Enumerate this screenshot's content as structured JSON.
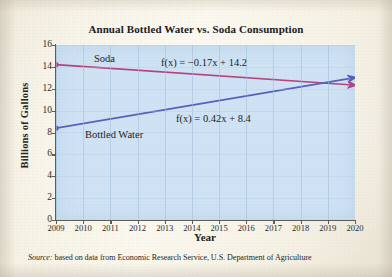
{
  "figure": {
    "title": "Annual Bottled Water vs. Soda Consumption",
    "source_prefix": "Source:",
    "source_text": " based on data from Economic Research Service, U.S. Department of Agriculture"
  },
  "axes": {
    "x_title": "Year",
    "y_title": "Billions of Gallons",
    "x_ticks": [
      "2009",
      "2010",
      "2011",
      "2012",
      "2013",
      "2014",
      "2015",
      "2016",
      "2017",
      "2018",
      "2019",
      "2020"
    ],
    "y_ticks": [
      "16",
      "14",
      "12",
      "10",
      "8",
      "6",
      "4",
      "2",
      "0"
    ]
  },
  "annotations": {
    "soda_label": "Soda",
    "bottled_water_label": "Bottled Water",
    "soda_equation_prefix": "f",
    "soda_equation": "f(x) = −0.17x + 14.2",
    "water_equation": "f(x) = 0.42x + 8.4"
  },
  "colors": {
    "plot_background": "#cfe3f5",
    "page_background": "#f4efe0",
    "soda_line": "#b8417f",
    "water_line": "#5560c0",
    "axis": "#5c5c58",
    "grid": "#a7c6e2"
  },
  "chart_data": {
    "type": "line",
    "title": "Annual Bottled Water vs. Soda Consumption",
    "xlabel": "Year",
    "ylabel": "Billions of Gallons",
    "xlim": [
      2009,
      2020
    ],
    "ylim": [
      0,
      16
    ],
    "y_ticks": [
      0,
      2,
      4,
      6,
      8,
      10,
      12,
      14,
      16
    ],
    "x_ticks": [
      2009,
      2010,
      2011,
      2012,
      2013,
      2014,
      2015,
      2016,
      2017,
      2018,
      2019,
      2020
    ],
    "grid": true,
    "legend": "inline-labels",
    "x": [
      2009,
      2020
    ],
    "series": [
      {
        "name": "Soda",
        "color": "#b8417f",
        "equation": "f(x) = -0.17x + 14.2",
        "slope": -0.17,
        "intercept": 14.2,
        "values": [
          14.2,
          12.33
        ],
        "marker_start": "dot",
        "marker_end": "arrow"
      },
      {
        "name": "Bottled Water",
        "color": "#5560c0",
        "equation": "f(x) = 0.42x + 8.4",
        "slope": 0.42,
        "intercept": 8.4,
        "values": [
          8.4,
          13.02
        ],
        "marker_start": "dot",
        "marker_end": "arrow"
      }
    ]
  }
}
